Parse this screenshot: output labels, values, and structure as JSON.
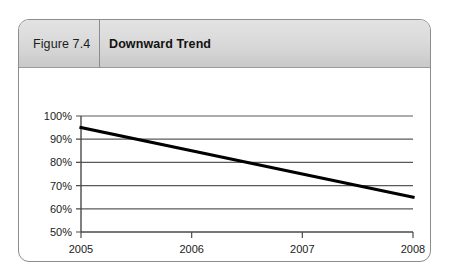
{
  "figure": {
    "label": "Figure 7.4",
    "title": "Downward Trend"
  },
  "chart_data": {
    "type": "line",
    "title": "Downward Trend",
    "xlabel": "",
    "ylabel": "",
    "x": [
      2005,
      2006,
      2007,
      2008
    ],
    "categories": [
      "2005",
      "2006",
      "2007",
      "2008"
    ],
    "series": [
      {
        "name": "Trend",
        "values": [
          95,
          85,
          75,
          65
        ],
        "color": "#000000"
      }
    ],
    "xlim": [
      2005,
      2008
    ],
    "ylim": [
      50,
      100
    ],
    "xticks": [
      "2005",
      "2006",
      "2007",
      "2008"
    ],
    "yticks": [
      "50%",
      "60%",
      "70%",
      "80%",
      "90%",
      "100%"
    ],
    "ytick_values": [
      50,
      60,
      70,
      80,
      90,
      100
    ],
    "grid": "horizontal",
    "legend": "none",
    "line_color": "#000000",
    "grid_color": "#5a5a5a",
    "axis_color": "#4a4a4a"
  }
}
